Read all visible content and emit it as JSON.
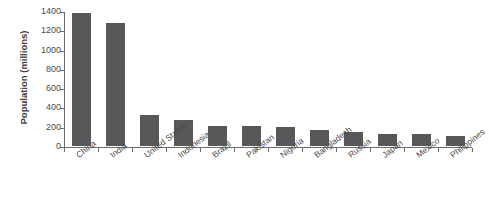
{
  "chart_data": {
    "type": "bar",
    "title": "",
    "subtitle": "",
    "xlabel": "",
    "ylabel": "Population (millions)",
    "ylim": [
      0,
      1400
    ],
    "ytick_labels": [
      "0",
      "200",
      "400",
      "600",
      "800",
      "1000",
      "1200",
      "1400"
    ],
    "ytick_values": [
      0,
      200,
      400,
      600,
      800,
      1000,
      1200,
      1400
    ],
    "grid": false,
    "legend": false,
    "legend_position": "none",
    "bar_color": "#58585a",
    "axis_color": "#6d6d6d",
    "background_color": "#ffffff",
    "categories": [
      "China",
      "India",
      "United States",
      "Indonesia",
      "Brazil",
      "Pakistan",
      "Nigeria",
      "Bangladesh",
      "Russia",
      "Japan",
      "Mexico",
      "Philippines"
    ],
    "values": [
      1380,
      1280,
      325,
      265,
      212,
      205,
      200,
      165,
      145,
      127,
      128,
      108
    ]
  }
}
